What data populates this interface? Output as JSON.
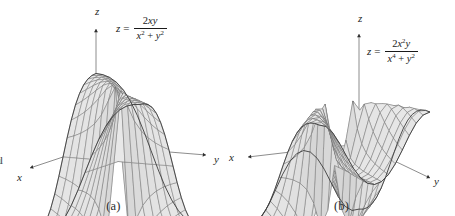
{
  "figure": {
    "background_color": "#ffffff",
    "surface_fill_color": "#c8c8c8",
    "surface_fill_light": "#d9d9d9",
    "mesh_line_color": "#6b6b6b",
    "outline_color": "#3c3c3c",
    "axis_color": "#707070",
    "text_color": "#1a1a1a",
    "edge_artifact": "ıl"
  },
  "panels": [
    {
      "id": "a",
      "caption": "(a)",
      "equation": {
        "lhs": "z",
        "relation": "=",
        "numerator_parts": [
          {
            "text": "2",
            "italic": false,
            "sup": ""
          },
          {
            "text": "x",
            "italic": true,
            "sup": ""
          },
          {
            "text": "y",
            "italic": true,
            "sup": ""
          }
        ],
        "denominator_parts": [
          {
            "text": "x",
            "italic": true,
            "sup": "2"
          },
          {
            "text": " + ",
            "italic": false,
            "sup": ""
          },
          {
            "text": "y",
            "italic": true,
            "sup": "2"
          }
        ],
        "plain": "z = 2xy / (x^2 + y^2)",
        "position": {
          "left": 116,
          "top": 14
        }
      },
      "axes": [
        {
          "name": "z",
          "label": "z",
          "label_pos": {
            "left": 95,
            "top": 6
          }
        },
        {
          "name": "x",
          "label": "x",
          "label_pos": {
            "left": 17,
            "top": 172
          }
        },
        {
          "name": "y",
          "label": "y",
          "label_pos": {
            "left": 214,
            "top": 154
          }
        }
      ],
      "chart_data": {
        "type": "surface",
        "function": "z = 2xy/(x^2 + y^2)",
        "title": "",
        "xlabel": "x",
        "ylabel": "y",
        "zlabel": "z",
        "zlim": [
          -1,
          1
        ],
        "discontinuity": "origin",
        "grid": true,
        "projection": {
          "origin_px": [
            96,
            146
          ],
          "x_axis_tip_px": [
            30,
            168
          ],
          "y_axis_tip_px": [
            206,
            155
          ],
          "z_axis_tip_px": [
            96,
            29
          ]
        },
        "mesh": {
          "u_lines": 16,
          "v_lines": 16
        }
      }
    },
    {
      "id": "b",
      "caption": "(b)",
      "equation": {
        "lhs": "z",
        "relation": "=",
        "numerator_parts": [
          {
            "text": "2",
            "italic": false,
            "sup": ""
          },
          {
            "text": "x",
            "italic": true,
            "sup": "2"
          },
          {
            "text": "y",
            "italic": true,
            "sup": ""
          }
        ],
        "denominator_parts": [
          {
            "text": "x",
            "italic": true,
            "sup": "4"
          },
          {
            "text": " + ",
            "italic": false,
            "sup": ""
          },
          {
            "text": "y",
            "italic": true,
            "sup": "2"
          }
        ],
        "plain": "z = 2x^2 y / (x^4 + y^2)",
        "position": {
          "left": 139,
          "top": 37
        }
      },
      "axes": [
        {
          "name": "z",
          "label": "z",
          "label_pos": {
            "left": 130,
            "top": 13
          }
        },
        {
          "name": "x",
          "label": "x",
          "label_pos": {
            "left": 1,
            "top": 152
          }
        },
        {
          "name": "y",
          "label": "y",
          "label_pos": {
            "left": 206,
            "top": 176
          }
        }
      ],
      "chart_data": {
        "type": "surface",
        "function": "z = 2x^2y/(x^4 + y^2)",
        "title": "",
        "xlabel": "x",
        "ylabel": "y",
        "zlabel": "z",
        "zlim": [
          -1,
          1
        ],
        "discontinuity": "origin",
        "grid": true,
        "projection": {
          "origin_px": [
            131,
            144
          ],
          "x_axis_tip_px": [
            20,
            157
          ],
          "y_axis_tip_px": [
            202,
            178
          ],
          "z_axis_tip_px": [
            131,
            34
          ]
        },
        "mesh": {
          "u_lines": 16,
          "v_lines": 16
        }
      }
    }
  ]
}
